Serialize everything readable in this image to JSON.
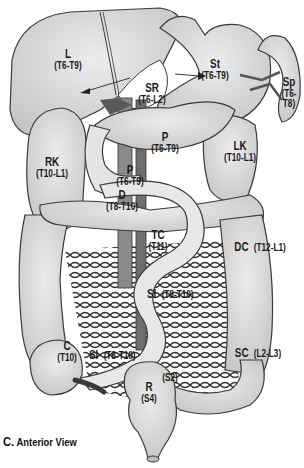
{
  "figure": {
    "caption_letter": "C.",
    "caption_text": "Anterior View",
    "colors": {
      "organ_fill": "#d6d6d6",
      "organ_light": "#e6e6e6",
      "outline": "#3a3a3a",
      "vessel": "#6e6e6e",
      "background": "#ffffff"
    }
  },
  "labels": {
    "liver": {
      "abbr": "L",
      "segments": "(T6-T9)"
    },
    "stomach": {
      "abbr": "St",
      "segments": "(T6-T9)"
    },
    "spleen": {
      "abbr": "Sp",
      "segments": "(T6-\nT8)",
      "seg1": "(T6-",
      "seg2": "T8)"
    },
    "suprarenal": {
      "abbr": "SR",
      "segments": "(T6-L2)"
    },
    "pancreas_body": {
      "abbr": "P",
      "segments": "(T6-T9)"
    },
    "pancreas_head": {
      "abbr": "P",
      "segments": "(T6-T9)"
    },
    "right_kidney": {
      "abbr": "RK",
      "segments": "(T10-L1)"
    },
    "left_kidney": {
      "abbr": "LK",
      "segments": "(T10-L1)"
    },
    "duodenum": {
      "abbr": "D",
      "segments": "(T8-T10)"
    },
    "transverse_colon": {
      "abbr": "TC",
      "segments": "(T11)"
    },
    "descending_colon": {
      "abbr": "DC",
      "segments": "(T12-L1)"
    },
    "small_intestine_mid": {
      "abbr": "SI",
      "segments": "(T8-T10)"
    },
    "small_intestine_low": {
      "abbr": "SI",
      "segments": "(T8-T10)"
    },
    "cecum": {
      "abbr": "C",
      "segments": "(T10)"
    },
    "sigmoid_colon": {
      "abbr": "SC",
      "segments": "(L2-L3)"
    },
    "rectum": {
      "abbr": "R",
      "segments": "(S4)"
    },
    "rectum_upper": {
      "segments": "(S2)"
    }
  }
}
